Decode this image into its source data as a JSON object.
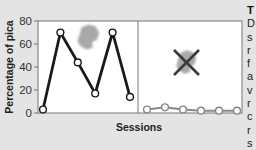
{
  "colors": {
    "background": "#e4e4e4",
    "plot_bg": "#ffffff",
    "axis": "#777777",
    "series_with_pica": "#1a1a1a",
    "series_without_pica": "#888888",
    "marker_fill": "#ffffff",
    "blob": "#9a9a9a",
    "x_mark": "#3a3a3a",
    "text": "#222222"
  },
  "chart_data": {
    "type": "line",
    "title": "",
    "xlabel": "Sessions",
    "ylabel": "Percentage of pica",
    "ylim": [
      0,
      80
    ],
    "yticks": [
      0,
      20,
      40,
      60,
      80
    ],
    "grid": false,
    "panels": [
      {
        "name": "with-item",
        "icon": "blob-icon",
        "crossed_out": false,
        "x": [
          1,
          2,
          3,
          4,
          5,
          6
        ],
        "series": [
          {
            "name": "Pica",
            "values": [
              3,
              70,
              44,
              17,
              70,
              14
            ]
          }
        ]
      },
      {
        "name": "item-removed",
        "icon": "blob-crossed-icon",
        "crossed_out": true,
        "x": [
          1,
          2,
          3,
          4,
          5,
          6
        ],
        "series": [
          {
            "name": "Pica",
            "values": [
              3,
              5,
              3,
              2,
              2,
              2
            ]
          }
        ]
      }
    ]
  },
  "sidebar": {
    "title": "T",
    "lines": [
      "D",
      "s",
      "r",
      "f",
      "a",
      "v",
      "r",
      "c",
      "r",
      "s"
    ]
  }
}
